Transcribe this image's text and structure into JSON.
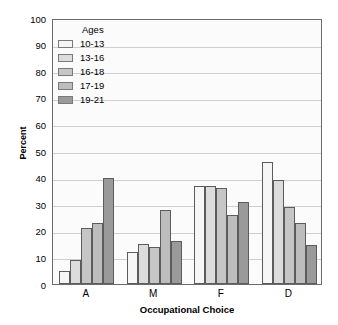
{
  "chart_data": {
    "type": "bar",
    "title": "",
    "xlabel": "Occupational Choice",
    "ylabel": "Percent",
    "categories": [
      "A",
      "M",
      "F",
      "D"
    ],
    "ylim": [
      0,
      100
    ],
    "yticks": [
      0,
      10,
      20,
      30,
      40,
      50,
      60,
      70,
      80,
      90,
      100
    ],
    "ytick_labels": [
      "0",
      "10",
      "20",
      "30",
      "40",
      "50",
      "60",
      "70",
      "80",
      "90",
      "100"
    ],
    "grid": true,
    "legend_title": "Ages",
    "legend_position": "upper-left-inside",
    "series": [
      {
        "name": "10-13",
        "values": [
          5,
          12,
          37,
          46
        ],
        "color": "#f6f6f6"
      },
      {
        "name": "13-16",
        "values": [
          9,
          15,
          37,
          39
        ],
        "color": "#dcdcdc"
      },
      {
        "name": "16-18",
        "values": [
          21,
          14,
          36,
          29
        ],
        "color": "#c6c6c6"
      },
      {
        "name": "17-19",
        "values": [
          23,
          28,
          26,
          23
        ],
        "color": "#bdbdbd"
      },
      {
        "name": "19-21",
        "values": [
          40,
          16,
          31,
          14.5
        ],
        "color": "#9a9a9a"
      }
    ]
  },
  "style": {
    "plot_background": "#fbfbfb",
    "axis_color": "#6b6b6b",
    "gridline_color": "#cfcfcf",
    "bar_edge_color": "#5c5c5c",
    "text_color": "#000000"
  }
}
